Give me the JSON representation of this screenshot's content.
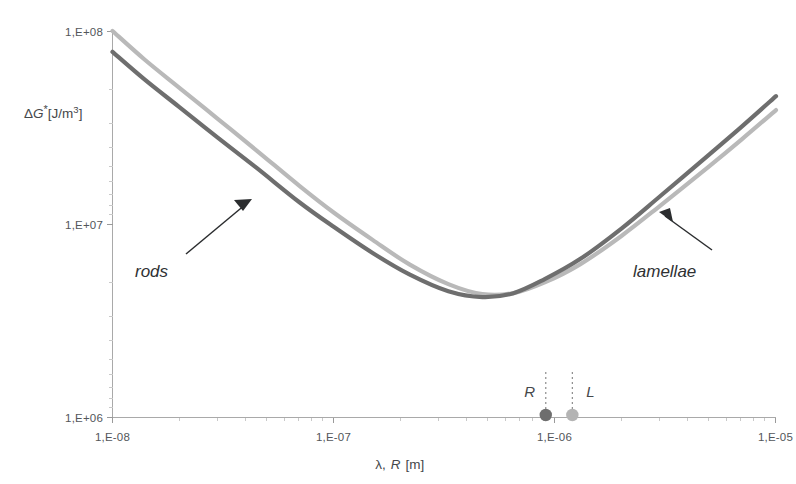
{
  "chart_data": {
    "type": "line",
    "title": "",
    "xlabel": "λ, R [m]",
    "ylabel": "ΔG* [J/m³]",
    "xscale": "log",
    "yscale": "log",
    "xlim": [
      1e-08,
      1e-05
    ],
    "ylim": [
      1000000.0,
      100000000.0
    ],
    "grid": false,
    "xticks": [
      "1,E-08",
      "1,E-07",
      "1,E-06",
      "1,E-05"
    ],
    "xtick_values": [
      1e-08,
      1e-07,
      1e-06,
      1e-05
    ],
    "yticks": [
      "1,E+06",
      "1,E+07",
      "1,E+08"
    ],
    "ytick_values": [
      1000000,
      10000000,
      100000000
    ],
    "legend_position": "inline-annotations",
    "series": [
      {
        "name": "rods",
        "color": "#6e6e6e",
        "annotation": "rods",
        "x": [
          1e-08,
          1.4e-08,
          2e-08,
          3e-08,
          4.5e-08,
          7e-08,
          1e-07,
          1.5e-07,
          2.2e-07,
          3.3e-07,
          4.7e-07,
          6.5e-07,
          9e-07,
          1.3e-06,
          2e-06,
          3e-06,
          5e-06,
          7e-06,
          1e-05
        ],
        "y": [
          78000000,
          56000000,
          40500000,
          28000000,
          19500000,
          13000000,
          9700000,
          7100000,
          5500000,
          4500000,
          4200000,
          4400000,
          5200000,
          6600000,
          9500000,
          14000000,
          23000000,
          32000000,
          46000000
        ]
      },
      {
        "name": "lamellae",
        "color": "#b9b9b9",
        "annotation": "lamellae",
        "x": [
          1e-08,
          1.4e-08,
          2e-08,
          3e-08,
          4.5e-08,
          7e-08,
          1e-07,
          1.5e-07,
          2.2e-07,
          3.3e-07,
          4.7e-07,
          6.5e-07,
          9e-07,
          1.3e-06,
          2e-06,
          3e-06,
          5e-06,
          7e-06,
          1e-05
        ],
        "y": [
          100000000,
          71000000,
          51000000,
          35000000,
          24000000,
          15800000,
          11500000,
          8300000,
          6200000,
          4900000,
          4350000,
          4400000,
          5000000,
          6200000,
          8700000,
          12500000,
          20000000,
          27500000,
          39000000
        ]
      }
    ],
    "markers": [
      {
        "label": "R",
        "x": 9.1e-07,
        "y": 1000000,
        "color": "#6e6e6e",
        "dropline": true
      },
      {
        "label": "L",
        "x": 1.2e-06,
        "y": 1000000,
        "color": "#b4b4b4",
        "dropline": true
      }
    ],
    "annotations": [
      {
        "text": "rods",
        "arrow_from_x": 1.85e-08,
        "arrow_from_y": 2400000,
        "arrow_to_x": 2.9e-08,
        "arrow_to_y": 5600000
      },
      {
        "text": "lamellae",
        "arrow_from_x": 4.3e-06,
        "arrow_from_y": 4900000,
        "arrow_to_x": 3e-06,
        "arrow_to_y": 9200000
      }
    ]
  },
  "axis": {
    "y_title_delta": "Δ",
    "y_title_g": "G",
    "y_title_star": "*",
    "y_title_unit": "[J/m",
    "y_title_exp": "3",
    "y_title_close": "]",
    "x_title_lambda": "λ,",
    "x_title_r": "R",
    "x_title_unit": "[m]"
  },
  "ticks": {
    "y": [
      "1,E+08",
      "1,E+07",
      "1,E+06"
    ],
    "x": [
      "1,E-08",
      "1,E-07",
      "1,E-06",
      "1,E-05"
    ]
  },
  "labels": {
    "rods": "rods",
    "lamellae": "lamellae",
    "marker_r": "R",
    "marker_l": "L"
  },
  "colors": {
    "rods_curve": "#6e6e6e",
    "lamellae_curve": "#b9b9b9",
    "axis": "#a9a9a9",
    "text": "#45484b",
    "marker_r": "#6e6e6e",
    "marker_l": "#b4b4b4"
  }
}
